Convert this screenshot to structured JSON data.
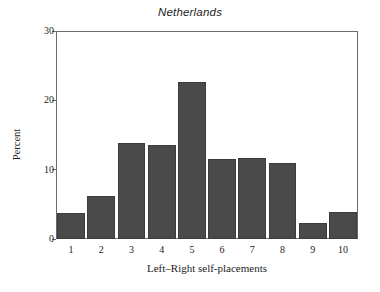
{
  "chart_data": {
    "type": "bar",
    "title": "Netherlands",
    "xlabel": "Left–Right self-placements",
    "ylabel": "Percent",
    "categories": [
      "1",
      "2",
      "3",
      "4",
      "5",
      "6",
      "7",
      "8",
      "9",
      "10"
    ],
    "values": [
      3.7,
      6.2,
      13.9,
      13.6,
      22.6,
      11.6,
      11.7,
      10.9,
      2.3,
      3.9
    ],
    "ylim": [
      0,
      30
    ],
    "yticks": [
      0,
      10,
      20,
      30
    ],
    "ytick_labels": [
      "0",
      "10",
      "20",
      "30"
    ],
    "grid": false,
    "legend": null,
    "bar_color": "#4a4a4a",
    "frame_color": "#6b6b6b",
    "background_color": "#ffffff"
  }
}
